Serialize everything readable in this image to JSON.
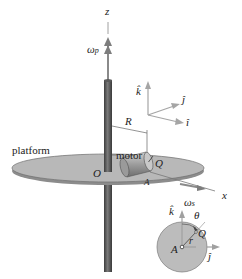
{
  "figure": {
    "type": "mechanics-diagram"
  },
  "labels": {
    "z_axis": "z",
    "omega_p": "ω",
    "omega_p_sub": "p",
    "k_hat_top": "k̂",
    "j_hat_top": "ĵ",
    "i_hat_top": "î",
    "R": "R",
    "platform": "platform",
    "motor": "motor",
    "O": "O",
    "Q_top": "Q",
    "A_top": "A",
    "x_axis": "x",
    "omega_s": "ω",
    "omega_s_sub": "s",
    "k_hat_detail": "k̂",
    "theta": "θ",
    "r": "r",
    "Q_detail": "Q",
    "A_detail": "A",
    "j_hat_detail": "ĵ"
  },
  "colors": {
    "shaft": "#555555",
    "platform_fill": "#b5b5b5",
    "arrow_gray": "#9a9a9a",
    "disk_fill": "#bdbdbd",
    "motor_fill": "#a8a8a8"
  }
}
